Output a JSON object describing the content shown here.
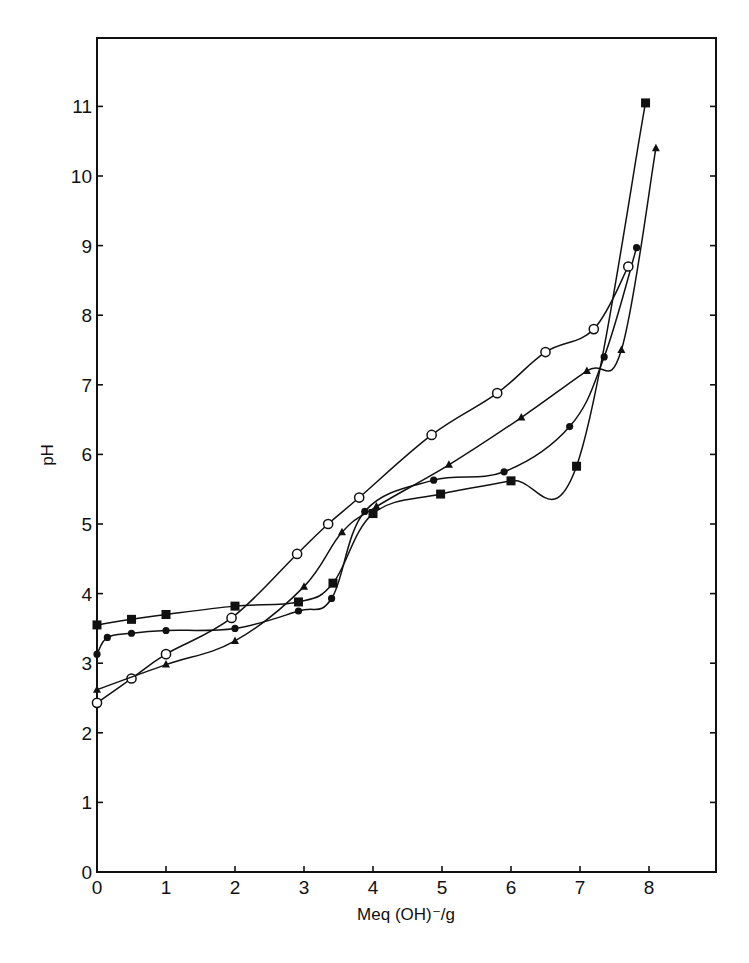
{
  "chart_data": {
    "type": "line",
    "title": "",
    "xlabel": "Meq (OH)⁻/g",
    "ylabel": "pH",
    "xlim": [
      0,
      9
    ],
    "ylim": [
      0,
      12
    ],
    "x_ticks": [
      0,
      1,
      2,
      3,
      4,
      5,
      6,
      7,
      8
    ],
    "y_ticks": [
      0,
      1,
      2,
      3,
      4,
      5,
      6,
      7,
      8,
      9,
      10,
      11
    ],
    "grid": false,
    "legend": null,
    "series": [
      {
        "name": "filled squares",
        "marker": "square-filled",
        "points": [
          [
            0,
            3.55
          ],
          [
            0.5,
            3.63
          ],
          [
            1.0,
            3.7
          ],
          [
            2.0,
            3.82
          ],
          [
            2.92,
            3.88
          ],
          [
            3.42,
            4.15
          ],
          [
            4.0,
            5.15
          ],
          [
            4.98,
            5.43
          ],
          [
            6.0,
            5.62
          ],
          [
            6.95,
            5.83
          ],
          [
            7.95,
            11.05
          ]
        ]
      },
      {
        "name": "filled circles",
        "marker": "circle-filled",
        "points": [
          [
            0,
            3.13
          ],
          [
            0.15,
            3.37
          ],
          [
            0.5,
            3.43
          ],
          [
            1.0,
            3.47
          ],
          [
            2.0,
            3.5
          ],
          [
            2.92,
            3.75
          ],
          [
            3.4,
            3.93
          ],
          [
            3.88,
            5.18
          ],
          [
            4.88,
            5.63
          ],
          [
            5.9,
            5.75
          ],
          [
            6.85,
            6.4
          ],
          [
            7.35,
            7.4
          ],
          [
            7.82,
            8.97
          ]
        ]
      },
      {
        "name": "open circles",
        "marker": "circle-open",
        "points": [
          [
            0,
            2.43
          ],
          [
            0.5,
            2.78
          ],
          [
            1.0,
            3.13
          ],
          [
            1.95,
            3.65
          ],
          [
            2.9,
            4.57
          ],
          [
            3.35,
            5.0
          ],
          [
            3.8,
            5.38
          ],
          [
            4.85,
            6.28
          ],
          [
            5.8,
            6.88
          ],
          [
            6.5,
            7.47
          ],
          [
            7.2,
            7.8
          ],
          [
            7.7,
            8.7
          ]
        ]
      },
      {
        "name": "filled triangles",
        "marker": "triangle-filled",
        "points": [
          [
            0,
            2.62
          ],
          [
            1.0,
            2.98
          ],
          [
            2.0,
            3.32
          ],
          [
            3.0,
            4.1
          ],
          [
            3.55,
            4.88
          ],
          [
            4.05,
            5.25
          ],
          [
            5.1,
            5.85
          ],
          [
            6.15,
            6.53
          ],
          [
            7.1,
            7.2
          ],
          [
            7.6,
            7.5
          ],
          [
            8.1,
            10.4
          ]
        ]
      }
    ]
  },
  "axes": {
    "x_title": "Meq (OH)⁻/g",
    "y_title": "pH"
  },
  "colors": {
    "ink": "#111111",
    "background": "#ffffff"
  }
}
